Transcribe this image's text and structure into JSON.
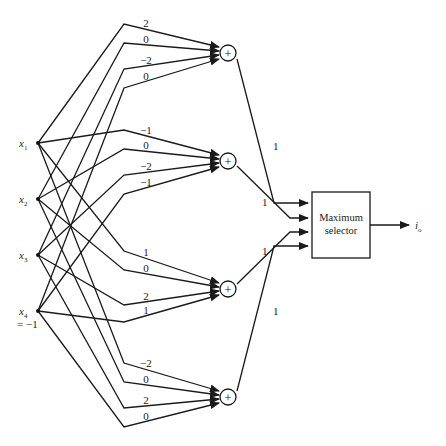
{
  "diagram": {
    "type": "neural-network-classifier",
    "inputs": [
      {
        "id": "x1",
        "label": "x",
        "subscript": "1",
        "extra": ""
      },
      {
        "id": "x2",
        "label": "x",
        "subscript": "2",
        "extra": ""
      },
      {
        "id": "x3",
        "label": "x",
        "subscript": "3",
        "extra": ""
      },
      {
        "id": "x4",
        "label": "x",
        "subscript": "4",
        "extra": "= −1"
      }
    ],
    "summing_nodes": [
      {
        "id": "sum1",
        "symbol": "+",
        "weights": [
          "2",
          "0",
          "−2",
          "0"
        ],
        "output_weight": "1"
      },
      {
        "id": "sum2",
        "symbol": "+",
        "weights": [
          "−1",
          "0",
          "−2",
          "−1"
        ],
        "output_weight": "1"
      },
      {
        "id": "sum3",
        "symbol": "+",
        "weights": [
          "1",
          "0",
          "2",
          "1"
        ],
        "output_weight": "1"
      },
      {
        "id": "sum4",
        "symbol": "+",
        "weights": [
          "−2",
          "0",
          "2",
          "0"
        ],
        "output_weight": "1"
      }
    ],
    "selector": {
      "line1": "Maximum",
      "line2": "selector"
    },
    "output": {
      "label": "i",
      "subscript": "o"
    }
  }
}
